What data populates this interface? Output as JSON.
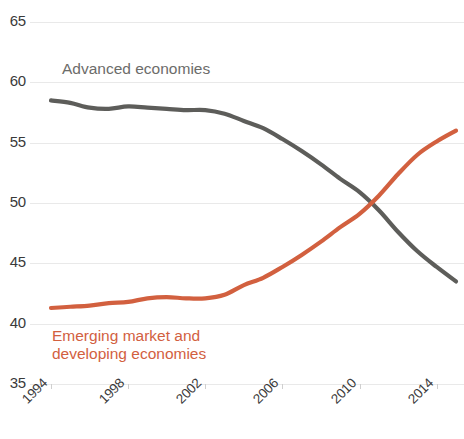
{
  "chart_data": {
    "type": "line",
    "title": "",
    "subtitle": "",
    "xlabel": "",
    "ylabel": "",
    "xlim": [
      1994,
      2015
    ],
    "ylim": [
      35,
      65
    ],
    "grid": true,
    "legend_position": "inline-annotations",
    "y_ticks": [
      35,
      40,
      45,
      50,
      55,
      60,
      65
    ],
    "x_ticks": [
      1994,
      1998,
      2002,
      2006,
      2010,
      2014
    ],
    "x_tick_labels": [
      "1994",
      "1998",
      "2002",
      "2006",
      "2010",
      "2014"
    ],
    "y_tick_labels": [
      "35",
      "40",
      "45",
      "50",
      "55",
      "60",
      "65"
    ],
    "x": [
      1994,
      1995,
      1996,
      1997,
      1998,
      1999,
      2000,
      2001,
      2002,
      2003,
      2004,
      2005,
      2006,
      2007,
      2008,
      2009,
      2010,
      2011,
      2012,
      2013,
      2014,
      2015
    ],
    "series": [
      {
        "name": "Advanced economies",
        "color": "#5d5d5a",
        "label_color": "#6c6c6a",
        "values": [
          58.5,
          58.3,
          57.9,
          57.8,
          58.0,
          57.9,
          57.8,
          57.7,
          57.7,
          57.4,
          56.8,
          56.2,
          55.3,
          54.3,
          53.2,
          52.0,
          50.9,
          49.4,
          47.6,
          46.0,
          44.7,
          43.5
        ]
      },
      {
        "name": "Emerging market and developing economies",
        "color": "#d2603f",
        "label_color": "#d2603f",
        "values": [
          41.3,
          41.4,
          41.5,
          41.7,
          41.8,
          42.1,
          42.2,
          42.1,
          42.1,
          42.4,
          43.2,
          43.8,
          44.7,
          45.7,
          46.8,
          48.0,
          49.1,
          50.6,
          52.4,
          54.0,
          55.1,
          56.0
        ]
      }
    ],
    "annotations": [
      {
        "text": "Advanced economies",
        "series": "Advanced economies",
        "x": 1995.5,
        "y": 61.2
      },
      {
        "text": "Emerging market and",
        "series": "Emerging market and developing economies",
        "x": 1994.6,
        "y": 39.4
      },
      {
        "text": "developing economies",
        "series": "Emerging market and developing economies",
        "x": 1994.6,
        "y": 38.0
      }
    ],
    "colors": {
      "advanced": "#5d5d5a",
      "emerging": "#d2603f",
      "gridline": "#e9e9e9",
      "tick_text": "#3a3a3a",
      "background": "#ffffff"
    }
  }
}
